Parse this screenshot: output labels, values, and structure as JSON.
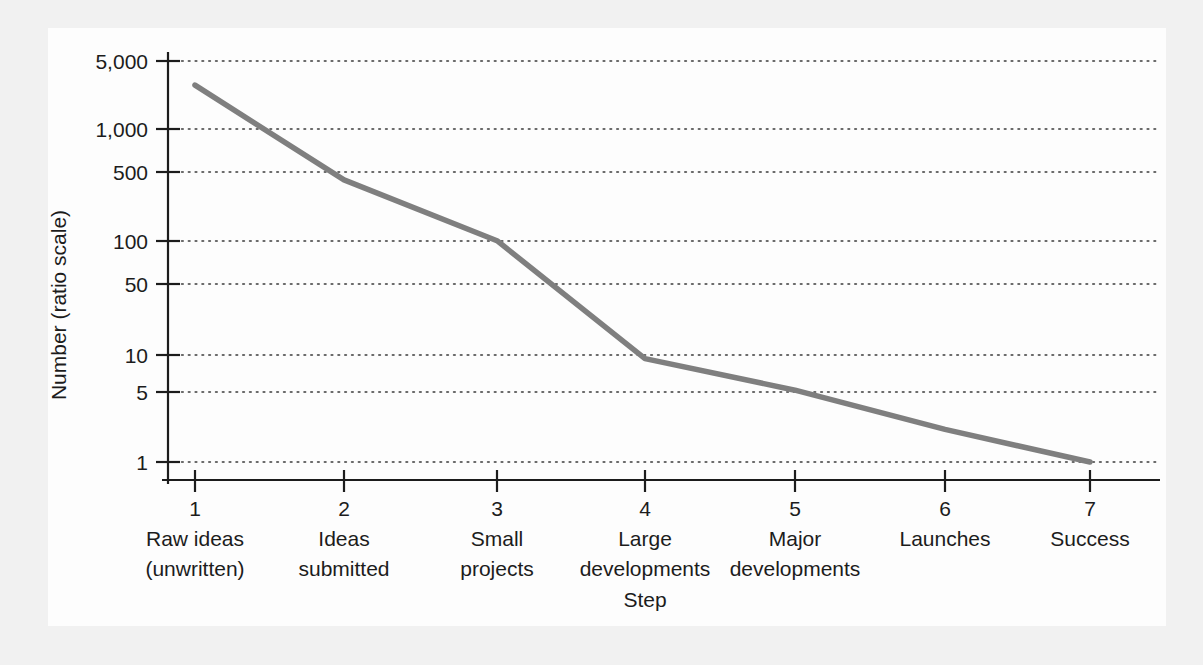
{
  "figure": {
    "background_color": "#f1f1f1",
    "panel_color": "#fdfdfd",
    "line_color": "#7f7f7f",
    "grid_color": "#3a3a3a",
    "axis_color": "#1c1c1c"
  },
  "chart_data": {
    "type": "line",
    "title": "",
    "subtitle": "",
    "xlabel": "Step",
    "ylabel": "Number (ratio scale)",
    "yscale": "log",
    "ylim": [
      0.7,
      7000
    ],
    "grid": true,
    "legend": null,
    "categories": [
      "1",
      "2",
      "3",
      "4",
      "5",
      "6",
      "7"
    ],
    "category_labels": [
      "Raw ideas\n(unwritten)",
      "Ideas\nsubmitted",
      "Small\nprojects",
      "Large\ndevelopments",
      "Major\ndevelopments",
      "Launches",
      "Success"
    ],
    "x": [
      1,
      2,
      3,
      4,
      5,
      6,
      7
    ],
    "values": [
      3000,
      400,
      110,
      9,
      4.6,
      2,
      1
    ],
    "ytick_values": [
      5000,
      1000,
      500,
      100,
      50,
      10,
      5,
      1
    ],
    "ytick_labels": [
      "5,000",
      "1,000",
      "500",
      "100",
      "50",
      "10",
      "5",
      "1"
    ],
    "series": [
      {
        "name": "Number of ideas",
        "values": [
          3000,
          400,
          110,
          9,
          4.6,
          2,
          1
        ]
      }
    ]
  },
  "axes": {
    "y_title": "Number (ratio scale)",
    "x_title": "Step",
    "y_ticks": [
      {
        "label": "5,000",
        "value": 5000
      },
      {
        "label": "1,000",
        "value": 1000
      },
      {
        "label": "500",
        "value": 500
      },
      {
        "label": "100",
        "value": 100
      },
      {
        "label": "50",
        "value": 50
      },
      {
        "label": "10",
        "value": 10
      },
      {
        "label": "5",
        "value": 5
      },
      {
        "label": "1",
        "value": 1
      }
    ],
    "x_ticks": [
      {
        "number": "1",
        "line1": "Raw ideas",
        "line2": "(unwritten)"
      },
      {
        "number": "2",
        "line1": "Ideas",
        "line2": "submitted"
      },
      {
        "number": "3",
        "line1": "Small",
        "line2": "projects"
      },
      {
        "number": "4",
        "line1": "Large",
        "line2": "developments"
      },
      {
        "number": "5",
        "line1": "Major",
        "line2": "developments"
      },
      {
        "number": "6",
        "line1": "Launches",
        "line2": ""
      },
      {
        "number": "7",
        "line1": "Success",
        "line2": ""
      }
    ]
  }
}
